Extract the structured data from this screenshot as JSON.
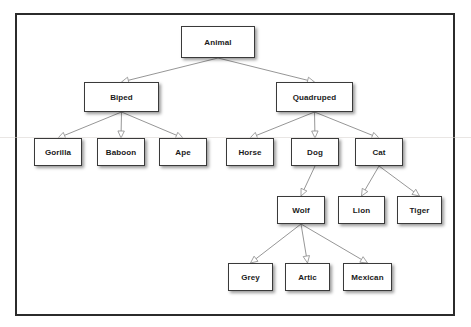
{
  "diagram": {
    "type": "tree",
    "style": {
      "frame_border_color": "#2b2b2b",
      "node_border_color": "#3a3a3a",
      "node_fill": "#ffffff",
      "edge_color": "#8a8a8a",
      "text_color": "#1a1a1a",
      "background": "#ffffff",
      "arrowhead": "hollow-triangle"
    },
    "nodes": [
      {
        "id": "animal",
        "label": "Animal",
        "x": 181,
        "y": 26,
        "w": 74,
        "h": 32,
        "level": 0
      },
      {
        "id": "biped",
        "label": "Biped",
        "x": 84,
        "y": 82,
        "w": 75,
        "h": 30,
        "level": 1
      },
      {
        "id": "quadruped",
        "label": "Quadruped",
        "x": 276,
        "y": 82,
        "w": 77,
        "h": 30,
        "level": 1
      },
      {
        "id": "gorilla",
        "label": "Gorilla",
        "x": 34,
        "y": 138,
        "w": 48,
        "h": 28,
        "level": 2
      },
      {
        "id": "baboon",
        "label": "Baboon",
        "x": 97,
        "y": 138,
        "w": 48,
        "h": 28,
        "level": 2
      },
      {
        "id": "ape",
        "label": "Ape",
        "x": 159,
        "y": 138,
        "w": 48,
        "h": 28,
        "level": 2
      },
      {
        "id": "horse",
        "label": "Horse",
        "x": 226,
        "y": 138,
        "w": 48,
        "h": 28,
        "level": 2
      },
      {
        "id": "dog",
        "label": "Dog",
        "x": 291,
        "y": 138,
        "w": 48,
        "h": 28,
        "level": 2
      },
      {
        "id": "cat",
        "label": "Cat",
        "x": 355,
        "y": 138,
        "w": 48,
        "h": 28,
        "level": 2
      },
      {
        "id": "wolf",
        "label": "Wolf",
        "x": 277,
        "y": 196,
        "w": 48,
        "h": 28,
        "level": 3
      },
      {
        "id": "lion",
        "label": "Lion",
        "x": 338,
        "y": 196,
        "w": 47,
        "h": 28,
        "level": 3
      },
      {
        "id": "tiger",
        "label": "Tiger",
        "x": 397,
        "y": 196,
        "w": 45,
        "h": 28,
        "level": 3
      },
      {
        "id": "grey",
        "label": "Grey",
        "x": 228,
        "y": 263,
        "w": 45,
        "h": 28,
        "level": 4
      },
      {
        "id": "artic",
        "label": "Artic",
        "x": 285,
        "y": 263,
        "w": 45,
        "h": 28,
        "level": 4
      },
      {
        "id": "mexican",
        "label": "Mexican",
        "x": 343,
        "y": 263,
        "w": 49,
        "h": 28,
        "level": 4
      }
    ],
    "edges": [
      {
        "from": "animal",
        "to": "biped"
      },
      {
        "from": "animal",
        "to": "quadruped"
      },
      {
        "from": "biped",
        "to": "gorilla"
      },
      {
        "from": "biped",
        "to": "baboon"
      },
      {
        "from": "biped",
        "to": "ape"
      },
      {
        "from": "quadruped",
        "to": "horse"
      },
      {
        "from": "quadruped",
        "to": "dog"
      },
      {
        "from": "quadruped",
        "to": "cat"
      },
      {
        "from": "dog",
        "to": "wolf"
      },
      {
        "from": "cat",
        "to": "lion"
      },
      {
        "from": "cat",
        "to": "tiger"
      },
      {
        "from": "wolf",
        "to": "grey"
      },
      {
        "from": "wolf",
        "to": "artic"
      },
      {
        "from": "wolf",
        "to": "mexican"
      }
    ]
  }
}
